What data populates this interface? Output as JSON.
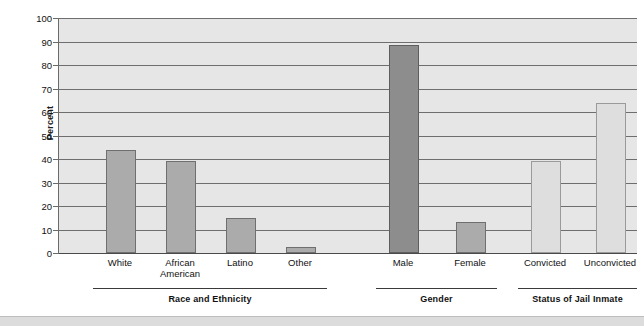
{
  "chart_data": {
    "type": "bar",
    "title": "",
    "xlabel": "",
    "ylabel": "Percent",
    "ylim": [
      0,
      100
    ],
    "ytick_step": 10,
    "yticks": [
      0,
      10,
      20,
      30,
      40,
      50,
      60,
      70,
      80,
      90,
      100
    ],
    "grid": true,
    "legend": "none",
    "categories": [
      "White",
      "African American",
      "Latino",
      "Other",
      "Male",
      "Female",
      "Convicted",
      "Unconvicted"
    ],
    "values": [
      44,
      39,
      15,
      2.5,
      88.5,
      13,
      39,
      64
    ],
    "bars": [
      {
        "label": "White",
        "label_lines": [
          "White"
        ],
        "value": 44,
        "shade": "shade-mid",
        "color": "#ababab",
        "group": "Race and Ethnicity"
      },
      {
        "label": "African American",
        "label_lines": [
          "African",
          "American"
        ],
        "value": 39,
        "shade": "shade-mid",
        "color": "#ababab",
        "group": "Race and Ethnicity"
      },
      {
        "label": "Latino",
        "label_lines": [
          "Latino"
        ],
        "value": 15,
        "shade": "shade-mid",
        "color": "#ababab",
        "group": "Race and Ethnicity"
      },
      {
        "label": "Other",
        "label_lines": [
          "Other"
        ],
        "value": 2.5,
        "shade": "shade-mid",
        "color": "#ababab",
        "group": "Race and Ethnicity"
      },
      {
        "label": "Male",
        "label_lines": [
          "Male"
        ],
        "value": 88.5,
        "shade": "shade-dark",
        "color": "#8d8d8d",
        "group": "Gender"
      },
      {
        "label": "Female",
        "label_lines": [
          "Female"
        ],
        "value": 13,
        "shade": "shade-mid",
        "color": "#ababab",
        "group": "Gender"
      },
      {
        "label": "Convicted",
        "label_lines": [
          "Convicted"
        ],
        "value": 39,
        "shade": "shade-light",
        "color": "#dedede",
        "group": "Status of Jail Inmate"
      },
      {
        "label": "Unconvicted",
        "label_lines": [
          "Unconvicted"
        ],
        "value": 64,
        "shade": "shade-light",
        "color": "#dedede",
        "group": "Status of Jail Inmate"
      }
    ],
    "groups": [
      {
        "label": "Race and Ethnicity",
        "bar_indices": [
          0,
          1,
          2,
          3
        ]
      },
      {
        "label": "Gender",
        "bar_indices": [
          4,
          5
        ]
      },
      {
        "label": "Status of Jail Inmate",
        "bar_indices": [
          6,
          7
        ]
      }
    ],
    "colors": {
      "plot_background": "#e6e6e6",
      "gridline": "#6e6e6e",
      "axis": "#4a4a4a",
      "text": "#111111",
      "bar_mid": "#ababab",
      "bar_dark": "#8d8d8d",
      "bar_light": "#dedede"
    }
  }
}
